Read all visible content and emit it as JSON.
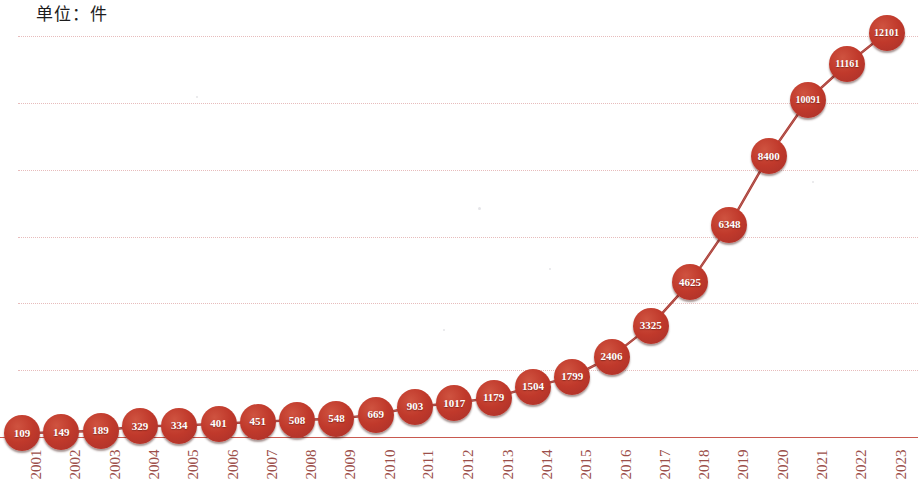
{
  "title": "单位：件",
  "colors": {
    "marker": "#c0392b",
    "marker_dark": "#a8302a",
    "line": "#b5362c",
    "gridline": "#e7bcbc",
    "baseline": "#c8594f",
    "axis_text": "#9c4f4a",
    "title_text": "#1d1d1d",
    "background": "#ffffff",
    "label_text": "#ffffff"
  },
  "chart_data": {
    "type": "line",
    "title": "单位：件",
    "subtitle": "",
    "xlabel": "",
    "ylabel": "",
    "ylim": [
      0,
      12000
    ],
    "xlim": [
      "2001",
      "2023"
    ],
    "grid": true,
    "gridline_values": [
      2000,
      4000,
      6000,
      8000,
      10000,
      12000
    ],
    "legend": [],
    "legend_position": "none",
    "point_labels_shown": true,
    "categories": [
      "2001",
      "2002",
      "2003",
      "2004",
      "2005",
      "2006",
      "2007",
      "2008",
      "2009",
      "2010",
      "2011",
      "2012",
      "2013",
      "2014",
      "2015",
      "2016",
      "2017",
      "2018",
      "2019",
      "2020",
      "2021",
      "2022",
      "2023"
    ],
    "values": [
      109,
      149,
      189,
      329,
      334,
      401,
      451,
      508,
      548,
      669,
      903,
      1017,
      1179,
      1504,
      1799,
      2406,
      3325,
      4625,
      6348,
      8400,
      10091,
      11161,
      12101
    ]
  }
}
